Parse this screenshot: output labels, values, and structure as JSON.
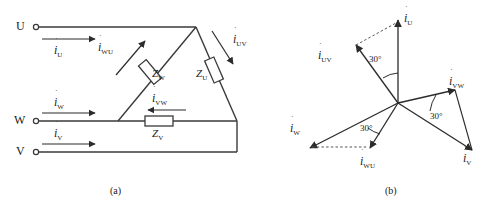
{
  "figure": {
    "captions": {
      "a": "(a)",
      "b": "(b)"
    }
  },
  "circuit": {
    "terminals": [
      {
        "name": "U",
        "label": "U"
      },
      {
        "name": "W",
        "label": "W"
      },
      {
        "name": "V",
        "label": "V"
      }
    ],
    "line_currents": [
      {
        "name": "i-U",
        "symbol": "i",
        "sub": "U"
      },
      {
        "name": "i-W",
        "symbol": "i",
        "sub": "W"
      },
      {
        "name": "i-V",
        "symbol": "i",
        "sub": "V"
      }
    ],
    "phase_currents": [
      {
        "name": "i-WU",
        "symbol": "i",
        "sub": "WU"
      },
      {
        "name": "i-UV",
        "symbol": "i",
        "sub": "UV"
      },
      {
        "name": "i-VW",
        "symbol": "i",
        "sub": "VW"
      }
    ],
    "impedances": [
      {
        "name": "Z-W",
        "symbol": "Z",
        "sub": "W"
      },
      {
        "name": "Z-U",
        "symbol": "Z",
        "sub": "U"
      },
      {
        "name": "Z-V",
        "symbol": "Z",
        "sub": "V"
      }
    ]
  },
  "phasor": {
    "vectors": [
      {
        "name": "i-U",
        "symbol": "i",
        "sub": "U"
      },
      {
        "name": "i-UV",
        "symbol": "i",
        "sub": "UV"
      },
      {
        "name": "i-VW",
        "symbol": "i",
        "sub": "VW"
      },
      {
        "name": "i-V",
        "symbol": "i",
        "sub": "V"
      },
      {
        "name": "i-W",
        "symbol": "i",
        "sub": "W"
      },
      {
        "name": "i-WU",
        "symbol": "i",
        "sub": "WU"
      }
    ],
    "angles": [
      {
        "name": "angle-upper",
        "label": "30°"
      },
      {
        "name": "angle-lower-left",
        "label": "30°"
      },
      {
        "name": "angle-lower-right",
        "label": "30°"
      }
    ]
  },
  "colors": {
    "line": "#3a3a3a",
    "text": "#1a1a1a",
    "dashed": "#555555"
  }
}
